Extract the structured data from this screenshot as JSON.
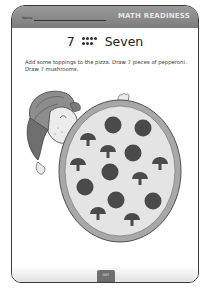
{
  "header": {
    "name_label": "Name",
    "title": "MATH READINESS"
  },
  "title": {
    "numeral": "7",
    "dot_pattern": {
      "top_row": 4,
      "bottom_row": 3
    },
    "word": "Seven"
  },
  "instructions": "Add some toppings to the pizza. Draw 7 pieces of pepperoni. Draw 7 mushrooms.",
  "illustration": {
    "description": "Boy in cap peeking from behind a large pizza",
    "pepperoni_count": 7,
    "mushroom_count": 7,
    "pepperoni": [
      [
        113,
        125
      ],
      [
        143,
        128
      ],
      [
        133,
        153
      ],
      [
        110,
        172
      ],
      [
        85,
        187
      ],
      [
        116,
        200
      ],
      [
        153,
        201
      ]
    ],
    "mushrooms": [
      [
        88,
        138
      ],
      [
        108,
        150
      ],
      [
        78,
        163
      ],
      [
        160,
        162
      ],
      [
        140,
        177
      ],
      [
        98,
        212
      ],
      [
        132,
        218
      ]
    ]
  },
  "footer": {
    "page_number": "007"
  },
  "colors": {
    "header_bg": "#8a8a8a",
    "header_text": "#e6e6e6",
    "topping": "#4a4a4a",
    "pizza_base": "#e4e4e4",
    "crust": "#9a9a9a"
  }
}
